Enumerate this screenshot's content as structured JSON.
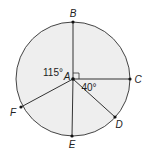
{
  "diagram": {
    "center": {
      "label": "A",
      "x": 73,
      "y": 79
    },
    "radius": 57,
    "colors": {
      "fill": "#eeeeee",
      "stroke": "#444444",
      "line": "#333333",
      "point": "#111111"
    },
    "points": [
      {
        "label": "B",
        "x": 73,
        "y": 22,
        "lx": 73,
        "ly": 17
      },
      {
        "label": "C",
        "x": 130,
        "y": 79,
        "lx": 138,
        "ly": 83
      },
      {
        "label": "D",
        "x": 115,
        "y": 117,
        "lx": 119,
        "ly": 128
      },
      {
        "label": "E",
        "x": 72,
        "y": 136,
        "lx": 72,
        "ly": 148
      },
      {
        "label": "F",
        "x": 21,
        "y": 107,
        "lx": 13,
        "ly": 116
      }
    ],
    "angles": [
      {
        "label": "115°",
        "x": 56,
        "y": 76
      },
      {
        "label": "40°",
        "x": 81,
        "y": 91
      }
    ],
    "right_angle_marker": {
      "between": [
        "B",
        "C"
      ]
    }
  }
}
